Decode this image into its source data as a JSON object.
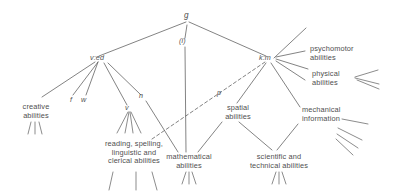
{
  "diagram": {
    "type": "tree-diagram",
    "stroke_color": "#5a5a5a",
    "text_color": "#4f4f4f",
    "background": "#ffffff"
  },
  "factors": {
    "general": "g",
    "general_sub": "(i)",
    "verbal_educational": "v:ed",
    "spatial_mechanical": "k:m",
    "fluency": "f",
    "word_fluency": "w",
    "verbal": "v",
    "number": "n",
    "perceptual": "p"
  },
  "groups": [
    {
      "key": "creative",
      "label": "creative\nabilities"
    },
    {
      "key": "reading",
      "label": "reading, spelling,\nlinguistic and\nclerical abilities"
    },
    {
      "key": "mathematical",
      "label": "mathematical\nabilities"
    },
    {
      "key": "spatial",
      "label": "spatial\nabilities"
    },
    {
      "key": "scientific",
      "label": "scientific and\ntechnical abilities"
    },
    {
      "key": "psychomotor",
      "label": "psychomotor\nabilities"
    },
    {
      "key": "physical",
      "label": "physical\nabilities"
    },
    {
      "key": "mechanical",
      "label": "mechanical\ninformation"
    }
  ]
}
